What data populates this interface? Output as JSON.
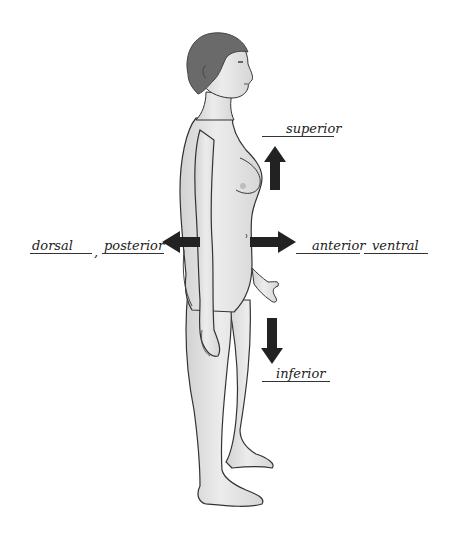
{
  "diagram": {
    "type": "anatomical-directional-terms",
    "figure": "human-figure-side-view",
    "figure_facing": "right",
    "labels": {
      "superior": "superior",
      "inferior": "inferior",
      "dorsal": "dorsal",
      "posterior": "posterior",
      "anterior": "anterior",
      "ventral": "ventral"
    },
    "arrows": [
      {
        "direction": "up",
        "term": "superior"
      },
      {
        "direction": "down",
        "term": "inferior"
      },
      {
        "direction": "left",
        "term": "dorsal / posterior"
      },
      {
        "direction": "right",
        "term": "anterior / ventral"
      }
    ],
    "colors": {
      "arrow": "#222222",
      "skin": "#e6e6e6",
      "skin_shade": "#c8c8c8",
      "hair": "#6a6a6a",
      "outline": "#333333"
    }
  }
}
